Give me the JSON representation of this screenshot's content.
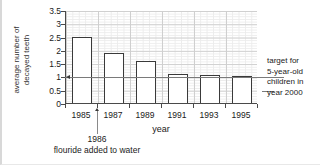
{
  "chart_data": {
    "type": "bar",
    "title": "",
    "xlabel": "year",
    "ylabel": "average number of decayed teeth",
    "ylabel_lines": [
      "average number of",
      "decayed teeth"
    ],
    "categories": [
      "1985",
      "1987",
      "1989",
      "1991",
      "1993",
      "1995"
    ],
    "values": [
      2.5,
      1.9,
      1.6,
      1.1,
      1.05,
      1.0
    ],
    "ylim": [
      0,
      3.5
    ],
    "yticks": [
      "0",
      "0.5",
      "1",
      "1.5",
      "2",
      "2.5",
      "3",
      "3.5"
    ],
    "ytick_values": [
      0,
      0.5,
      1,
      1.5,
      2,
      2.5,
      3,
      3.5
    ],
    "grid": true,
    "legend": "none",
    "series": [
      {
        "name": "average number of decayed teeth",
        "values": [
          2.5,
          1.9,
          1.6,
          1.1,
          1.05,
          1.0
        ]
      }
    ],
    "annotations": [
      {
        "name": "target-line",
        "type": "hline",
        "value": 1.0,
        "label_lines": [
          "target for",
          "5-year-old",
          "children in",
          "year 2000"
        ]
      },
      {
        "name": "fluoride-event",
        "type": "xmarker",
        "x": "1986",
        "label_lines": [
          "1986",
          "flouride added to water"
        ]
      }
    ]
  },
  "axis": {
    "x_title": "year",
    "y_title_line1": "average number of",
    "y_title_line2": "decayed teeth"
  },
  "target_note": {
    "line1": "target for",
    "line2": "5-year-old",
    "line3": "children in",
    "line4": "year 2000"
  },
  "event_note": {
    "line1": "1986",
    "line2": "flouride added to water"
  },
  "colors": {
    "bar_fill": "#ffffff",
    "bar_stroke": "#3a3a3a",
    "axis": "#4a4a4a",
    "grid_major": "#cfcfcf",
    "grid_minor": "#ececec",
    "target_line": "#7a7a7a",
    "text": "#1a1a1a"
  }
}
